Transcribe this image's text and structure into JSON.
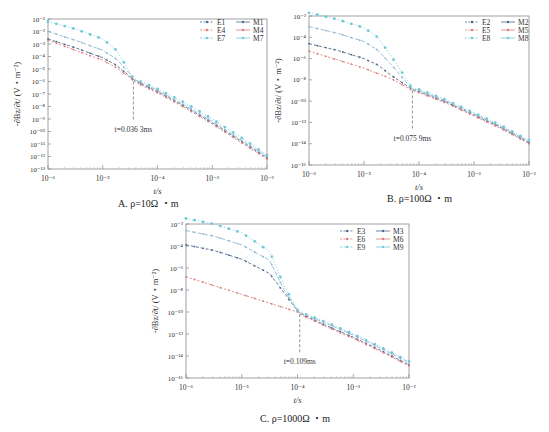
{
  "figure": {
    "panels": [
      {
        "id": "A",
        "caption": "A. ρ=10Ω ・m"
      },
      {
        "id": "B",
        "caption": "B. ρ=100Ω ・m"
      },
      {
        "id": "C",
        "caption": "C. ρ=1000Ω ・m"
      }
    ]
  },
  "chart_data": [
    {
      "type": "line",
      "title": "A. ρ=10Ω ・m",
      "xlabel": "t/s",
      "ylabel": "-∂Bz/∂t/ (V・m⁻²)",
      "xscale": "log",
      "yscale": "log",
      "xlim_log10": [
        -6,
        -2
      ],
      "ylim_log10": [
        -13,
        -1
      ],
      "xticks": [
        "10⁻⁶",
        "10⁻⁵",
        "10⁻⁴",
        "10⁻³",
        "10⁻²"
      ],
      "yticks": [
        "10⁻¹",
        "10⁻²",
        "10⁻³",
        "10⁻⁴",
        "10⁻⁵",
        "10⁻⁶",
        "10⁻⁷",
        "10⁻⁸",
        "10⁻⁹",
        "10⁻¹⁰",
        "10⁻¹¹",
        "10⁻¹²",
        "10⁻¹³"
      ],
      "ytick_values_log10": [
        -1,
        -2,
        -3,
        -4,
        -5,
        -6,
        -7,
        -8,
        -9,
        -10,
        -11,
        -12,
        -13
      ],
      "legend": [
        "E1",
        "E4",
        "E7",
        "M1",
        "M4",
        "M7"
      ],
      "legend_position": "upper right",
      "grid": false,
      "annotation": {
        "text": "t=0.036 3ms",
        "t_log10": -4.44,
        "y_log10": -6.0
      },
      "x_log10": [
        -6,
        -5.5,
        -5,
        -4.75,
        -4.5,
        -4.44,
        -4.25,
        -4,
        -3.5,
        -3,
        -2.5,
        -2
      ],
      "series": [
        {
          "name": "E1/M1",
          "color": "#4d6a8a",
          "y_log10": [
            -2.6,
            -3.3,
            -4.1,
            -4.7,
            -5.6,
            -5.85,
            -6.3,
            -6.8,
            -8.0,
            -9.3,
            -10.7,
            -12.1
          ]
        },
        {
          "name": "E4/M4",
          "color": "#e07a7a",
          "y_log10": [
            -2.7,
            -3.5,
            -4.3,
            -4.9,
            -5.7,
            -5.95,
            -6.4,
            -6.9,
            -8.1,
            -9.4,
            -10.8,
            -12.2
          ]
        },
        {
          "name": "E7/M7",
          "color": "#6fcad8",
          "y_log10": [
            -1.2,
            -1.8,
            -2.6,
            -3.5,
            -5.3,
            -5.8,
            -6.1,
            -6.6,
            -7.7,
            -9.0,
            -10.4,
            -11.9
          ]
        },
        {
          "name": "mid",
          "color": "#8fb8d0",
          "y_log10": [
            -2.0,
            -2.7,
            -3.5,
            -4.2,
            -5.4,
            -5.8,
            -6.2,
            -6.7,
            -7.9,
            -9.2,
            -10.6,
            -12.0
          ]
        }
      ]
    },
    {
      "type": "line",
      "title": "B. ρ=100Ω ・m",
      "xlabel": "t/s",
      "ylabel": "-∂Bz/∂t/ (V・m⁻²)",
      "xscale": "log",
      "yscale": "log",
      "xlim_log10": [
        -6,
        -2
      ],
      "ylim_log10": [
        -16,
        -2
      ],
      "xticks": [
        "10⁻⁶",
        "10⁻⁵",
        "10⁻⁴",
        "10⁻³",
        "10⁻²"
      ],
      "yticks": [
        "10⁻²",
        "10⁻⁴",
        "10⁻⁶",
        "10⁻⁸",
        "10⁻¹⁰",
        "10⁻¹²",
        "10⁻¹⁴",
        "10⁻¹⁶"
      ],
      "ytick_values_log10": [
        -2,
        -4,
        -6,
        -8,
        -10,
        -12,
        -14,
        -16
      ],
      "legend": [
        "E2",
        "E5",
        "E8",
        "M2",
        "M5",
        "M8"
      ],
      "legend_position": "upper right",
      "grid": false,
      "annotation": {
        "text": "t=0.075 9ms",
        "t_log10": -4.12,
        "y_log10": -9.0
      },
      "x_log10": [
        -6,
        -5.5,
        -5,
        -4.75,
        -4.5,
        -4.12,
        -4,
        -3.5,
        -3,
        -2.5,
        -2
      ],
      "series": [
        {
          "name": "E2/M2",
          "color": "#4d6a8a",
          "y_log10": [
            -4.6,
            -5.2,
            -6.0,
            -6.6,
            -7.6,
            -8.9,
            -9.1,
            -10.1,
            -11.3,
            -12.5,
            -13.9
          ]
        },
        {
          "name": "E5/M5",
          "color": "#e07a7a",
          "y_log10": [
            -5.3,
            -6.1,
            -6.9,
            -7.4,
            -7.9,
            -9.0,
            -9.2,
            -10.2,
            -11.4,
            -12.6,
            -14.0
          ]
        },
        {
          "name": "E8/M8",
          "color": "#6fcad8",
          "y_log10": [
            -1.7,
            -2.3,
            -3.1,
            -4.0,
            -5.8,
            -8.8,
            -8.9,
            -9.9,
            -11.1,
            -12.3,
            -13.7
          ]
        },
        {
          "name": "mid",
          "color": "#8fb8d0",
          "y_log10": [
            -3.0,
            -3.6,
            -4.4,
            -5.2,
            -6.6,
            -8.9,
            -9.0,
            -10.0,
            -11.2,
            -12.4,
            -13.8
          ]
        }
      ]
    },
    {
      "type": "line",
      "title": "C. ρ=1000Ω ・m",
      "xlabel": "t/s",
      "ylabel": "-∂Bz/∂t/ (V・m⁻²)",
      "xscale": "log",
      "yscale": "log",
      "xlim_log10": [
        -6,
        -2
      ],
      "ylim_log10": [
        -16,
        -2
      ],
      "xticks": [
        "10⁻⁶",
        "10⁻⁵",
        "10⁻⁴",
        "10⁻³",
        "10⁻²"
      ],
      "yticks": [
        "10⁻²",
        "10⁻⁴",
        "10⁻⁶",
        "10⁻⁸",
        "10⁻¹⁰",
        "10⁻¹²",
        "10⁻¹⁴",
        "10⁻¹⁶"
      ],
      "ytick_values_log10": [
        -2,
        -4,
        -6,
        -8,
        -10,
        -12,
        -14,
        -16
      ],
      "legend": [
        "E3",
        "E6",
        "E9",
        "M3",
        "M6",
        "M9"
      ],
      "legend_position": "upper right",
      "grid": false,
      "annotation": {
        "text": "t=0.109ms",
        "t_log10": -3.96,
        "y_log10": -10.2
      },
      "x_log10": [
        -6,
        -5.5,
        -5,
        -4.5,
        -4.25,
        -4,
        -3.96,
        -3.5,
        -3,
        -2.5,
        -2
      ],
      "series": [
        {
          "name": "E3/M3",
          "color": "#4d6a8a",
          "y_log10": [
            -3.9,
            -4.4,
            -5.2,
            -6.5,
            -8.2,
            -9.9,
            -10.1,
            -11.2,
            -12.3,
            -13.5,
            -14.8
          ]
        },
        {
          "name": "E6/M6",
          "color": "#e07a7a",
          "y_log10": [
            -6.8,
            -7.6,
            -8.4,
            -9.2,
            -9.6,
            -10.0,
            -10.2,
            -11.3,
            -12.4,
            -13.6,
            -14.9
          ]
        },
        {
          "name": "E9/M9",
          "color": "#6fcad8",
          "y_log10": [
            -1.5,
            -2.0,
            -2.8,
            -4.5,
            -7.5,
            -9.8,
            -10.0,
            -10.9,
            -12.0,
            -13.2,
            -14.5
          ]
        },
        {
          "name": "mid",
          "color": "#8fb8d0",
          "y_log10": [
            -2.6,
            -3.1,
            -3.9,
            -5.3,
            -7.9,
            -9.9,
            -10.05,
            -11.0,
            -12.1,
            -13.3,
            -14.6
          ]
        }
      ]
    }
  ]
}
